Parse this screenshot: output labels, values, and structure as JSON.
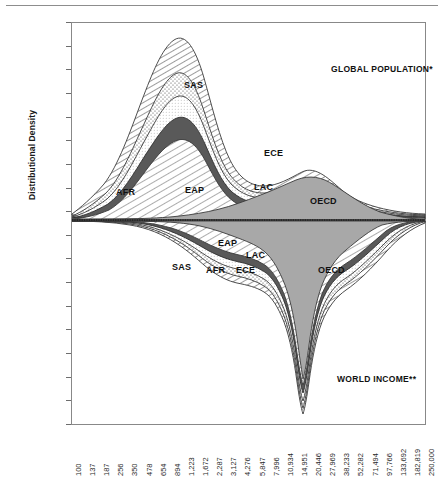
{
  "chart_data": {
    "type": "area",
    "title": "",
    "ylabel": "Distributional Density",
    "xlabel": "",
    "grid": false,
    "legend_position": "in-plot labels",
    "annotations": [
      {
        "text": "GLOBAL POPULATION*",
        "x_px": 331,
        "y_px": 64
      },
      {
        "text": "WORLD INCOME**",
        "x_px": 337,
        "y_px": 374
      }
    ],
    "ylim": [
      -0.45,
      0.4
    ],
    "yticks": [
      "0.400",
      "0.350",
      "0.300",
      "0.250",
      "0.200",
      "0.150",
      "0.100",
      "0.050",
      "0.000",
      "(0.050)",
      "(0.100)",
      "(0.150)",
      "(0.200)",
      "(0.250)",
      "(0.300)",
      "(0.350)",
      "(0.400)",
      "(0.450)"
    ],
    "ytick_values": [
      0.4,
      0.35,
      0.3,
      0.25,
      0.2,
      0.15,
      0.1,
      0.05,
      0.0,
      -0.05,
      -0.1,
      -0.15,
      -0.2,
      -0.25,
      -0.3,
      -0.35,
      -0.4,
      -0.45
    ],
    "xticks": [
      "100",
      "137",
      "187",
      "256",
      "350",
      "478",
      "654",
      "894",
      "1,223",
      "1,672",
      "2,287",
      "3,127",
      "4,276",
      "5,847",
      "7,996",
      "10,934",
      "14,951",
      "20,446",
      "27,969",
      "38,233",
      "52,282",
      "71,494",
      "97,766",
      "133,692",
      "182,819",
      "250,000"
    ],
    "xtick_values": [
      100,
      137,
      187,
      256,
      350,
      478,
      654,
      894,
      1223,
      1672,
      2287,
      3127,
      4276,
      5847,
      7996,
      10934,
      14951,
      20446,
      27969,
      38233,
      52282,
      71494,
      97766,
      133692,
      182819,
      250000
    ],
    "x_scale": "log",
    "series": [
      {
        "name": "SAS",
        "label": "SAS",
        "pattern": "diagonal-hatch-dense",
        "upper_peak": 0.35,
        "lower_peak": -0.115
      },
      {
        "name": "AFR",
        "label": "AFR",
        "pattern": "stipple-dots",
        "upper_peak": 0.235,
        "lower_peak": -0.1
      },
      {
        "name": "ECE",
        "label": "ECE",
        "pattern": "fine-stipple",
        "upper_peak": 0.2,
        "lower_peak": -0.092
      },
      {
        "name": "LAC",
        "label": "LAC",
        "pattern": "solid-dark-gray",
        "upper_peak": 0.182,
        "lower_peak": -0.082
      },
      {
        "name": "EAP",
        "label": "EAP",
        "pattern": "diagonal-hatch-wide",
        "upper_peak": 0.16,
        "lower_peak": -0.068
      },
      {
        "name": "OECD",
        "label": "OECD",
        "pattern": "solid-mid-gray",
        "upper_peak": 0.118,
        "lower_peak": -0.42
      }
    ],
    "region_labels_top": [
      {
        "text": "SAS",
        "x_px": 184,
        "y_px": 80
      },
      {
        "text": "AFR",
        "x_px": 116,
        "y_px": 187
      },
      {
        "text": "EAP",
        "x_px": 185,
        "y_px": 185
      },
      {
        "text": "ECE",
        "x_px": 264,
        "y_px": 148
      },
      {
        "text": "LAC",
        "x_px": 254,
        "y_px": 182
      },
      {
        "text": "OECD",
        "x_px": 310,
        "y_px": 196
      }
    ],
    "region_labels_bottom": [
      {
        "text": "SAS",
        "x_px": 172,
        "y_px": 262
      },
      {
        "text": "EAP",
        "x_px": 218,
        "y_px": 238
      },
      {
        "text": "AFR",
        "x_px": 206,
        "y_px": 265
      },
      {
        "text": "ECE",
        "x_px": 236,
        "y_px": 265
      },
      {
        "text": "LAC",
        "x_px": 246,
        "y_px": 250
      },
      {
        "text": "OECD",
        "x_px": 318,
        "y_px": 265
      }
    ],
    "colors": {
      "solid_mid_gray": "#a8a8a8",
      "solid_dark_gray": "#595959",
      "hatch_line": "#4d4d4d",
      "axis": "#555555",
      "text": "#1a1a1a",
      "background": "#ffffff"
    }
  },
  "axes": {
    "ylabel": "Distributional Density"
  }
}
